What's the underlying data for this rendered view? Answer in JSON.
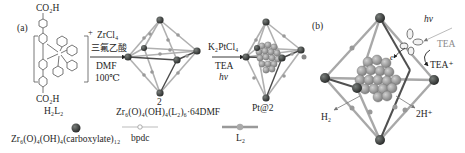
{
  "panels": {
    "a": {
      "label": "(a)",
      "ligand": {
        "top_group": "CO₂H",
        "bottom_group": "CO₂H",
        "name": "H₂L₂",
        "charge": "+",
        "atom_labels": [
          "N",
          "N",
          "N",
          "N",
          "Ir",
          "N"
        ]
      },
      "step1": {
        "reagents_above": [
          "ZrCl₄",
          "三氟乙酸"
        ],
        "conditions_below": [
          "DMF",
          "100℃"
        ]
      },
      "product1": {
        "id": "2",
        "formula": "Zr₆(O)₄(OH)₄(L₂)₆·64DMF"
      },
      "step2": {
        "reagents_above": [
          "K₂PtCl₄"
        ],
        "conditions_below": [
          "TEA",
          "hν"
        ]
      },
      "product2": {
        "id": "Pt@2"
      },
      "legend": [
        {
          "symbol": "sphere",
          "text": "Zr₆(O)₄(OH)₄(carboxylate)₁₂"
        },
        {
          "symbol": "thin-rod",
          "text": "bpdc"
        },
        {
          "symbol": "thick-rod",
          "text": "L₂"
        }
      ]
    },
    "b": {
      "label": "(b)",
      "photon": "hν",
      "electron": "e",
      "donor": "TEA",
      "donor_oxidized": "TEA⁺",
      "product_left": "H₂",
      "product_right": "2H⁺"
    }
  },
  "colors": {
    "node": "#3a3d3b",
    "linker_dark": "#4a4a4a",
    "linker_grey": "#a9a9a9",
    "linker_bead": "#9a9a9a",
    "pt_cluster": "#8f8f8f",
    "faded_text": "#8a8a8a"
  }
}
